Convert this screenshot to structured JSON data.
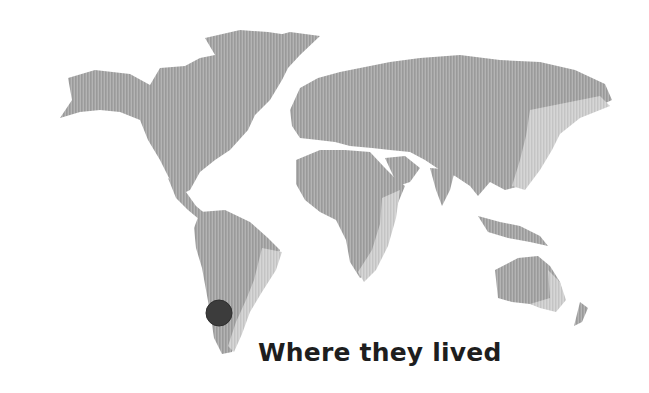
{
  "map": {
    "title": "Where they lived",
    "land_color": "#a6a6a6",
    "shade_color": "#cfcfcf",
    "marker": {
      "label": "location-marker",
      "region": "Southern South America (Chile/Argentina)",
      "cx": 219,
      "cy": 313,
      "r": 13,
      "color": "#3c3c3c"
    }
  }
}
